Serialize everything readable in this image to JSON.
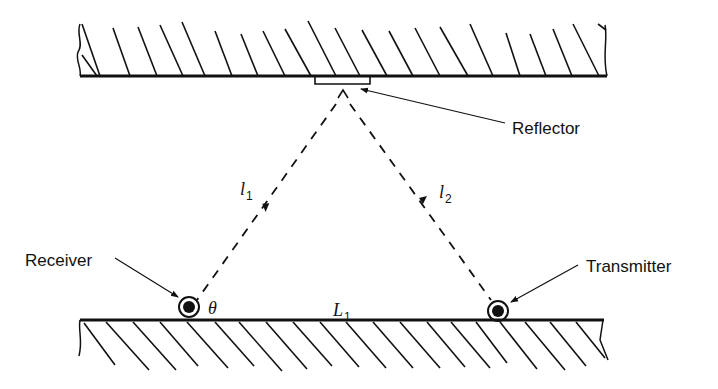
{
  "labels": {
    "reflector": "Reflector",
    "receiver": "Receiver",
    "transmitter": "Transmitter",
    "path1": "l",
    "path1_sub": "1",
    "path2": "l",
    "path2_sub": "2",
    "distance": "L",
    "distance_sub": "1",
    "angle": "θ"
  }
}
